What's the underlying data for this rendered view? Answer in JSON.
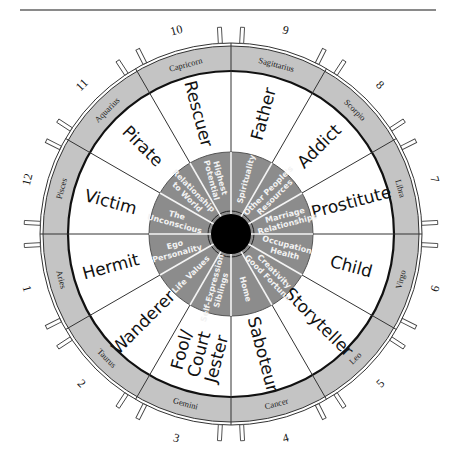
{
  "diagram": {
    "type": "archetype-wheel",
    "center": [
      231,
      234
    ],
    "colors": {
      "ring_gray": "#c4c4c4",
      "inner_gray": "#8c8c8c",
      "center_black": "#000000",
      "line": "#333333",
      "background": "#ffffff"
    },
    "segments": [
      {
        "house_number": "9",
        "sign": "Sagittarius",
        "archetype": "Father",
        "house": [
          "Spirituality"
        ]
      },
      {
        "house_number": "8",
        "sign": "Scorpio",
        "archetype": "Addict",
        "house": [
          "Other People's",
          "Resources"
        ]
      },
      {
        "house_number": "7",
        "sign": "Libra",
        "archetype": "Prostitute",
        "house": [
          "Marriage",
          "Relationships"
        ]
      },
      {
        "house_number": "6",
        "sign": "Virgo",
        "archetype": "Child",
        "house": [
          "Occupation",
          "Health"
        ]
      },
      {
        "house_number": "5",
        "sign": "Leo",
        "archetype": "Storyteller",
        "house": [
          "Creativity",
          "Good Fortune"
        ]
      },
      {
        "house_number": "4",
        "sign": "Cancer",
        "archetype": "Saboteur",
        "house": [
          "Home"
        ]
      },
      {
        "house_number": "3",
        "sign": "Gemini",
        "archetype": [
          "Fool/",
          "Court",
          "Jester"
        ],
        "house": [
          "Self-Expression",
          "Siblings"
        ]
      },
      {
        "house_number": "2",
        "sign": "Taurus",
        "archetype": "Wanderer",
        "house": [
          "Life Values"
        ]
      },
      {
        "house_number": "1",
        "sign": "Aries",
        "archetype": "Hermit",
        "house": [
          "Ego",
          "Personality"
        ]
      },
      {
        "house_number": "12",
        "sign": "Pisces",
        "archetype": "Victim",
        "house": [
          "The",
          "Unconscious"
        ]
      },
      {
        "house_number": "11",
        "sign": "Aquarius",
        "archetype": "Pirate",
        "house": [
          "Relationship",
          "to World"
        ]
      },
      {
        "house_number": "10",
        "sign": "Capricorn",
        "archetype": "Rescuer",
        "house": [
          "Highest",
          "Potential"
        ]
      }
    ]
  }
}
